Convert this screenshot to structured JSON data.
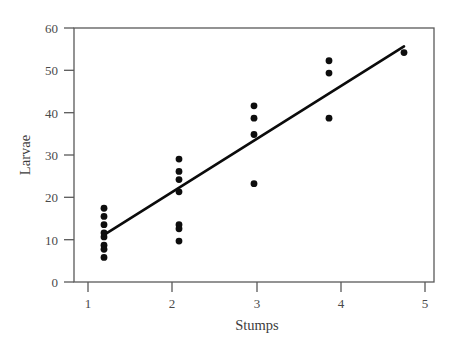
{
  "chart_data": {
    "type": "scatter",
    "title": "",
    "xlabel": "Stumps",
    "ylabel": "Larvae",
    "xlim": [
      0.6,
      5.4
    ],
    "ylim": [
      0,
      62
    ],
    "xticks": [
      1,
      2,
      3,
      4,
      5
    ],
    "xtick_labels": [
      "1",
      "2",
      "3",
      "4",
      "5"
    ],
    "yticks": [
      0,
      10,
      20,
      30,
      40,
      50,
      60
    ],
    "ytick_labels": [
      "0",
      "10",
      "20",
      "30",
      "40",
      "50",
      "60"
    ],
    "grid": false,
    "legend": null,
    "frame": "box",
    "marker": "filled-circle",
    "marker_color": "#0d0d0d",
    "line_color": "#0b0b0b",
    "points": [
      {
        "x": 1,
        "y": 18
      },
      {
        "x": 1,
        "y": 16
      },
      {
        "x": 1,
        "y": 14
      },
      {
        "x": 1,
        "y": 12
      },
      {
        "x": 1,
        "y": 11
      },
      {
        "x": 1,
        "y": 9
      },
      {
        "x": 1,
        "y": 8
      },
      {
        "x": 1,
        "y": 6
      },
      {
        "x": 2,
        "y": 30
      },
      {
        "x": 2,
        "y": 27
      },
      {
        "x": 2,
        "y": 25
      },
      {
        "x": 2,
        "y": 22
      },
      {
        "x": 2,
        "y": 14
      },
      {
        "x": 2,
        "y": 13
      },
      {
        "x": 2,
        "y": 10
      },
      {
        "x": 3,
        "y": 43
      },
      {
        "x": 3,
        "y": 40
      },
      {
        "x": 3,
        "y": 36
      },
      {
        "x": 3,
        "y": 24
      },
      {
        "x": 4,
        "y": 54
      },
      {
        "x": 4,
        "y": 51
      },
      {
        "x": 4,
        "y": 40
      },
      {
        "x": 5,
        "y": 56
      }
    ],
    "fit_line": {
      "type": "linear-regression",
      "x_start": 1,
      "y_start": 11.5,
      "x_end": 5,
      "y_end": 57.5
    }
  }
}
